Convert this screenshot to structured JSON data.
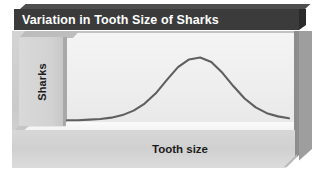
{
  "figure": {
    "title": "Variation in Tooth Size of Sharks",
    "y_axis_label": "Sharks",
    "x_axis_label": "Tooth size",
    "title_bar_color": "#3b3b3b",
    "title_text_color": "#ffffff",
    "curve_color": "#5f5f5f",
    "panel_color": "#efefef",
    "frame_color": "#d2d2d2",
    "side_face_color": "#9e9e9e"
  },
  "chart_data": {
    "type": "line",
    "title": "Variation in Tooth Size of Sharks",
    "xlabel": "Tooth size",
    "ylabel": "Sharks",
    "grid": false,
    "legend": null,
    "axis_ticks": [],
    "xlim": [
      0,
      1
    ],
    "ylim": [
      0,
      1
    ],
    "x": [
      0.0,
      0.05,
      0.1,
      0.15,
      0.2,
      0.25,
      0.3,
      0.35,
      0.4,
      0.45,
      0.5,
      0.55,
      0.6,
      0.65,
      0.7,
      0.75,
      0.8,
      0.85,
      0.9,
      0.95,
      1.0
    ],
    "y": [
      0.02,
      0.02,
      0.03,
      0.04,
      0.06,
      0.1,
      0.17,
      0.28,
      0.44,
      0.65,
      0.85,
      0.97,
      1.0,
      0.93,
      0.76,
      0.55,
      0.36,
      0.22,
      0.13,
      0.08,
      0.05
    ],
    "series": [
      {
        "name": "Sharks",
        "values": [
          0.02,
          0.02,
          0.03,
          0.04,
          0.06,
          0.1,
          0.17,
          0.28,
          0.44,
          0.65,
          0.85,
          0.97,
          1.0,
          0.93,
          0.76,
          0.55,
          0.36,
          0.22,
          0.13,
          0.08,
          0.05
        ]
      }
    ],
    "peak_x": 0.6,
    "peak_y": 1.0
  }
}
